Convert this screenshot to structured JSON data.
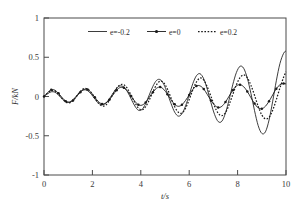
{
  "chart_data": {
    "type": "line",
    "title": "",
    "xlabel": "t/s",
    "ylabel": "F/kN",
    "xlim": [
      0,
      10
    ],
    "ylim": [
      -1,
      1
    ],
    "xticks": [
      0,
      2,
      4,
      6,
      8,
      10
    ],
    "yticks": [
      -1,
      -0.5,
      0,
      0.5,
      1
    ],
    "xticklabels": [
      "0",
      "2",
      "4",
      "6",
      "8",
      "10"
    ],
    "yticklabels": [
      "-1",
      "-0.5",
      "0",
      "0.5",
      "1"
    ],
    "grid": false,
    "legend_position": "top-center",
    "series": [
      {
        "name": "e=-0.2",
        "style": "solid",
        "marker": "none",
        "color": "#1a1a1a",
        "description": "Growing oscillation, amplitude rises from ~0.03 near t=0 to ~0.67 at t=9.5",
        "x": [
          0,
          0.15,
          0.3,
          0.45,
          0.6,
          0.75,
          0.9,
          1.05,
          1.2,
          1.35,
          1.5,
          1.65,
          1.8,
          1.95,
          2.1,
          2.25,
          2.4,
          2.55,
          2.7,
          2.85,
          3,
          3.15,
          3.3,
          3.45,
          3.6,
          3.75,
          3.9,
          4.05,
          4.2,
          4.35,
          4.5,
          4.65,
          4.8,
          4.95,
          5.1,
          5.25,
          5.4,
          5.55,
          5.7,
          5.85,
          6,
          6.15,
          6.3,
          6.45,
          6.6,
          6.75,
          6.9,
          7.05,
          7.2,
          7.35,
          7.5,
          7.65,
          7.8,
          7.95,
          8.1,
          8.25,
          8.4,
          8.55,
          8.7,
          8.85,
          9,
          9.15,
          9.3,
          9.45,
          9.6,
          9.75,
          9.9,
          10
        ],
        "y": [
          0,
          0.035,
          0.06,
          0.055,
          0.02,
          -0.03,
          -0.065,
          -0.07,
          -0.04,
          0.01,
          0.06,
          0.085,
          0.075,
          0.03,
          -0.03,
          -0.085,
          -0.105,
          -0.085,
          -0.03,
          0.04,
          0.105,
          0.135,
          0.12,
          0.06,
          -0.03,
          -0.12,
          -0.175,
          -0.165,
          -0.09,
          0.02,
          0.13,
          0.205,
          0.215,
          0.155,
          0.04,
          -0.09,
          -0.2,
          -0.25,
          -0.22,
          -0.12,
          0.02,
          0.165,
          0.265,
          0.29,
          0.225,
          0.09,
          -0.08,
          -0.23,
          -0.32,
          -0.315,
          -0.21,
          -0.04,
          0.15,
          0.305,
          0.385,
          0.36,
          0.235,
          0.04,
          -0.18,
          -0.37,
          -0.47,
          -0.45,
          -0.3,
          -0.06,
          0.2,
          0.42,
          0.55,
          0.58
        ]
      },
      {
        "name": "e=0",
        "style": "solid-with-markers",
        "marker": "dot",
        "color": "#1a1a1a",
        "description": "Low amplitude oscillation, stays near +/-0.15 throughout",
        "x": [
          0,
          0.15,
          0.3,
          0.45,
          0.6,
          0.75,
          0.9,
          1.05,
          1.2,
          1.35,
          1.5,
          1.65,
          1.8,
          1.95,
          2.1,
          2.25,
          2.4,
          2.55,
          2.7,
          2.85,
          3,
          3.15,
          3.3,
          3.45,
          3.6,
          3.75,
          3.9,
          4.05,
          4.2,
          4.35,
          4.5,
          4.65,
          4.8,
          4.95,
          5.1,
          5.25,
          5.4,
          5.55,
          5.7,
          5.85,
          6,
          6.15,
          6.3,
          6.45,
          6.6,
          6.75,
          6.9,
          7.05,
          7.2,
          7.35,
          7.5,
          7.65,
          7.8,
          7.95,
          8.1,
          8.25,
          8.4,
          8.55,
          8.7,
          8.85,
          9,
          9.15,
          9.3,
          9.45,
          9.6,
          9.75,
          9.9,
          10
        ],
        "y": [
          0,
          0.05,
          0.085,
          0.08,
          0.04,
          -0.015,
          -0.06,
          -0.075,
          -0.05,
          0,
          0.055,
          0.09,
          0.09,
          0.05,
          -0.01,
          -0.065,
          -0.095,
          -0.085,
          -0.04,
          0.02,
          0.08,
          0.115,
          0.11,
          0.07,
          0.005,
          -0.06,
          -0.105,
          -0.11,
          -0.075,
          -0.01,
          0.055,
          0.105,
          0.12,
          0.09,
          0.03,
          -0.04,
          -0.1,
          -0.125,
          -0.105,
          -0.05,
          0.02,
          0.09,
          0.135,
          0.135,
          0.095,
          0.025,
          -0.05,
          -0.11,
          -0.14,
          -0.125,
          -0.07,
          0.005,
          0.08,
          0.135,
          0.15,
          0.125,
          0.065,
          -0.015,
          -0.09,
          -0.145,
          -0.155,
          -0.125,
          -0.06,
          0.02,
          0.1,
          0.15,
          0.165,
          0.16
        ]
      },
      {
        "name": "e=0.2",
        "style": "dotted",
        "marker": "none",
        "color": "#1a1a1a",
        "description": "Moderately growing oscillation reaching ~0.3 near t=9.5, phase-shifted from the solid curve",
        "x": [
          0,
          0.15,
          0.3,
          0.45,
          0.6,
          0.75,
          0.9,
          1.05,
          1.2,
          1.35,
          1.5,
          1.65,
          1.8,
          1.95,
          2.1,
          2.25,
          2.4,
          2.55,
          2.7,
          2.85,
          3,
          3.15,
          3.3,
          3.45,
          3.6,
          3.75,
          3.9,
          4.05,
          4.2,
          4.35,
          4.5,
          4.65,
          4.8,
          4.95,
          5.1,
          5.25,
          5.4,
          5.55,
          5.7,
          5.85,
          6,
          6.15,
          6.3,
          6.45,
          6.6,
          6.75,
          6.9,
          7.05,
          7.2,
          7.35,
          7.5,
          7.65,
          7.8,
          7.95,
          8.1,
          8.25,
          8.4,
          8.55,
          8.7,
          8.85,
          9,
          9.15,
          9.3,
          9.45,
          9.6,
          9.75,
          9.9,
          10
        ],
        "y": [
          0,
          0.045,
          0.075,
          0.07,
          0.03,
          -0.025,
          -0.07,
          -0.08,
          -0.05,
          0.005,
          0.065,
          0.1,
          0.095,
          0.05,
          -0.02,
          -0.085,
          -0.12,
          -0.11,
          -0.05,
          0.03,
          0.105,
          0.15,
          0.15,
          0.1,
          0.015,
          -0.075,
          -0.145,
          -0.17,
          -0.13,
          -0.045,
          0.06,
          0.15,
          0.195,
          0.175,
          0.095,
          -0.02,
          -0.13,
          -0.2,
          -0.21,
          -0.15,
          -0.04,
          0.085,
          0.185,
          0.235,
          0.21,
          0.12,
          0,
          -0.125,
          -0.215,
          -0.245,
          -0.205,
          -0.105,
          0.025,
          0.15,
          0.24,
          0.275,
          0.24,
          0.145,
          0.015,
          -0.125,
          -0.235,
          -0.285,
          -0.265,
          -0.175,
          -0.04,
          0.11,
          0.245,
          0.315
        ]
      }
    ]
  },
  "legend": {
    "entries": [
      {
        "label": "e=-0.2",
        "style": "solid"
      },
      {
        "label": "e=0",
        "style": "solid-with-markers"
      },
      {
        "label": "e=0.2",
        "style": "dotted"
      }
    ]
  }
}
